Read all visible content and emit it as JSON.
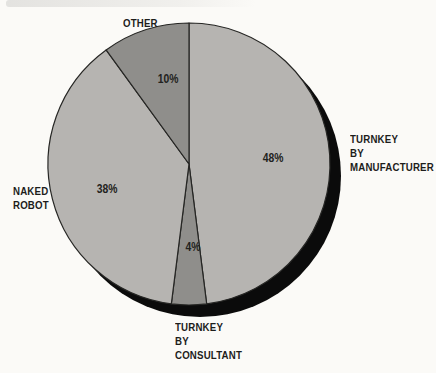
{
  "chart_data": {
    "type": "pie",
    "title": "",
    "unit": "%",
    "start_angle_deg": 0,
    "direction": "clockwise",
    "legend_position": "none",
    "background_color": "#fbfaf7",
    "outline_color": "#262624",
    "shadow_color": "#0b0b0b",
    "light_slice_color": "#b6b4b1",
    "dark_slice_color": "#8f8e8b",
    "slices": [
      {
        "label": "TURNKEY BY MANUFACTURER",
        "label_lines": [
          "TURNKEY",
          "BY",
          "MANUFACTURER"
        ],
        "value": 48,
        "display": "48%",
        "color": "#b6b4b1"
      },
      {
        "label": "TURNKEY BY CONSULTANT",
        "label_lines": [
          "TURNKEY",
          "BY",
          "CONSULTANT"
        ],
        "value": 4,
        "display": "4%",
        "color": "#8f8e8b"
      },
      {
        "label": "NAKED ROBOT",
        "label_lines": [
          "NAKED",
          "ROBOT"
        ],
        "value": 38,
        "display": "38%",
        "color": "#b6b4b1"
      },
      {
        "label": "OTHER",
        "label_lines": [
          "OTHER"
        ],
        "value": 10,
        "display": "10%",
        "color": "#8f8e8b"
      }
    ]
  }
}
